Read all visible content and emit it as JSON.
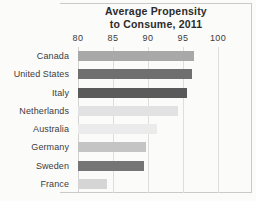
{
  "chart_data": {
    "type": "bar",
    "orientation": "horizontal",
    "title": "Average Propensity to Consume, 2011",
    "title_lines": [
      "Average Propensity",
      "to Consume, 2011"
    ],
    "xlabel": "",
    "ylabel": "",
    "xlim": [
      80,
      100
    ],
    "xticks": [
      80,
      85,
      90,
      95,
      100
    ],
    "xtick_labels": [
      "80",
      "85",
      "90",
      "95",
      "100"
    ],
    "grid": true,
    "grid_axis": "x",
    "legend": false,
    "categories": [
      "Canada",
      "United States",
      "Italy",
      "Netherlands",
      "Australia",
      "Germany",
      "Sweden",
      "France"
    ],
    "values": [
      96.5,
      96.3,
      95.6,
      94.3,
      91.3,
      89.7,
      89.4,
      84.2
    ],
    "bar_colors": [
      "#a8a8a8",
      "#6f6f6f",
      "#5a5a5a",
      "#e2e2e2",
      "#ebebeb",
      "#c4c4c4",
      "#757575",
      "#d5d5d5"
    ],
    "bars": [
      {
        "label": "Canada",
        "value": 96.5,
        "color": "#a8a8a8"
      },
      {
        "label": "United States",
        "value": 96.3,
        "color": "#6f6f6f"
      },
      {
        "label": "Italy",
        "value": 95.6,
        "color": "#5a5a5a"
      },
      {
        "label": "Netherlands",
        "value": 94.3,
        "color": "#e2e2e2"
      },
      {
        "label": "Australia",
        "value": 91.3,
        "color": "#ebebeb"
      },
      {
        "label": "Germany",
        "value": 89.7,
        "color": "#c4c4c4"
      },
      {
        "label": "Sweden",
        "value": 89.4,
        "color": "#757575"
      },
      {
        "label": "France",
        "value": 84.2,
        "color": "#d5d5d5"
      }
    ]
  },
  "style": {
    "background": "#fbfbfa",
    "frame_color": "#c9c9c9",
    "gridline_color": "#dedede",
    "title_color": "#2b2b2b",
    "label_color": "#3c3c3c"
  }
}
